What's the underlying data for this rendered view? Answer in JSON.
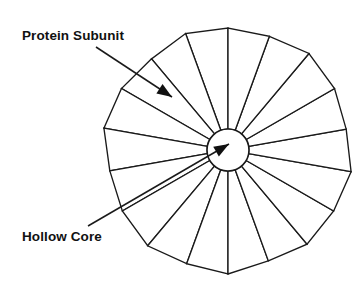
{
  "figure": {
    "type": "schematic-diagram",
    "background_color": "#ffffff",
    "line_color": "#1a1a1a",
    "fill_color": "#ffffff"
  },
  "labels": {
    "protein_subunit": {
      "text": "Protein Subunit",
      "x": 22,
      "y": 40
    },
    "hollow_core": {
      "text": "Hollow Core",
      "x": 22,
      "y": 241
    }
  },
  "leaders": {
    "protein_subunit": {
      "from_x": 96,
      "from_y": 47,
      "to_x": 172,
      "to_y": 97,
      "arrow_angle_deg": 33
    },
    "hollow_core": {
      "from_x": 88,
      "from_y": 226,
      "to_x": 229,
      "to_y": 144,
      "arrow_angle_deg": -30
    }
  },
  "structure": {
    "center_x": 228,
    "center_y": 150,
    "outer_radius": 122,
    "core_radius": 21,
    "subunit_count": 18,
    "start_angle_deg": 90,
    "radius_jitter": [
      0,
      2,
      -3,
      1,
      4,
      -2,
      0,
      3,
      -1,
      2,
      -4,
      1,
      0,
      3,
      -2,
      1,
      4,
      -1
    ]
  },
  "chart_data": {
    "type": "diagram",
    "title": "",
    "annotations": [
      "Protein Subunit",
      "Hollow Core"
    ],
    "elements": {
      "wedges": 18,
      "core": 1
    }
  }
}
